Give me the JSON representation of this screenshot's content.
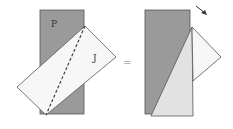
{
  "labels": {
    "p": "P",
    "j": "J",
    "equals": "="
  },
  "colors": {
    "gray": "#9a9a9a",
    "white": "#f7f7f7",
    "light": "#e2e2e2",
    "stroke": "#555555"
  }
}
